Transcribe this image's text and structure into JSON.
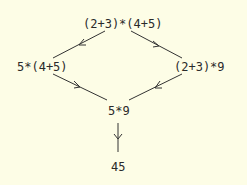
{
  "nodes": {
    "root": "(2+3)*(4+5)",
    "left": "5*(4+5)",
    "right": "(2+3)*9",
    "middle": "5*9",
    "result": "45"
  },
  "edges": [
    {
      "from": "root",
      "to": "left"
    },
    {
      "from": "root",
      "to": "right"
    },
    {
      "from": "left",
      "to": "middle"
    },
    {
      "from": "right",
      "to": "middle"
    },
    {
      "from": "middle",
      "to": "result"
    }
  ],
  "colors": {
    "background": "#fdfde6",
    "ink": "#2a2a2a"
  }
}
